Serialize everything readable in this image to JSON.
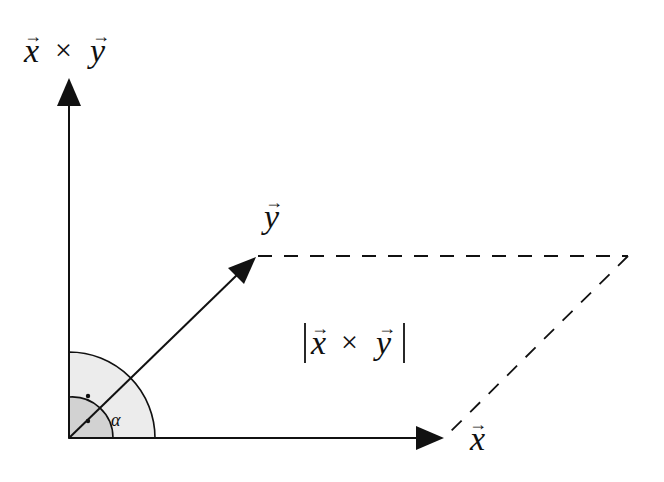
{
  "diagram": {
    "type": "cross-product-parallelogram",
    "labels": {
      "axis_up": {
        "a": "x",
        "op": "×",
        "b": "y"
      },
      "vector_y": "y",
      "vector_x": "x",
      "area": {
        "a": "x",
        "op": "×",
        "b": "y"
      },
      "angle": "α",
      "arrow_glyph": "→"
    },
    "colors": {
      "stroke": "#111111",
      "inner_arc_fill": "#cfcfcf",
      "outer_arc_fill": "#e8e8e8",
      "background": "#ffffff"
    },
    "geometry": {
      "origin": [
        69,
        438
      ],
      "axis_up_tip": [
        69,
        78
      ],
      "x_tip": [
        444,
        438
      ],
      "y_tip": [
        256,
        257
      ],
      "parallelogram_far_corner": [
        628,
        256
      ]
    }
  }
}
